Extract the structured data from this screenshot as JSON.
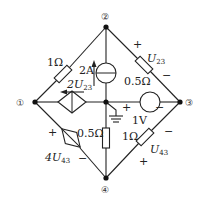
{
  "nodes": [
    {
      "id": "1",
      "label": "①"
    },
    {
      "id": "2",
      "label": "②"
    },
    {
      "id": "3",
      "label": "③"
    },
    {
      "id": "4",
      "label": "④"
    }
  ],
  "components": {
    "r12": {
      "value": "1Ω"
    },
    "cs2a": {
      "value": "2A"
    },
    "ccs": {
      "value_main": "2U",
      "value_sub": "23"
    },
    "r23": {
      "value": "0.5Ω"
    },
    "u23_label": {
      "main": "U",
      "sub": "23",
      "plus": "+",
      "minus": "−"
    },
    "vs1v": {
      "value": "1V",
      "plus": "+",
      "minus": "−"
    },
    "r24": {
      "value": "0.5Ω"
    },
    "r34": {
      "value": "1Ω"
    },
    "u43_label": {
      "main": "U",
      "sub": "43",
      "plus": "+",
      "minus": "−"
    },
    "vcvs": {
      "value_main": "4U",
      "value_sub": "43",
      "plus": "+",
      "minus": "−"
    }
  }
}
